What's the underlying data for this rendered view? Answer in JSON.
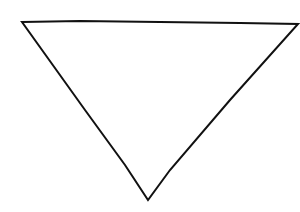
{
  "diagram": {
    "shape": "inverted-triangle",
    "style": "hand-drawn line art",
    "stroke_color": "#111111",
    "fill_color": "#ffffff",
    "background_color": "#ffffff",
    "vertices": {
      "top_left": [
        22,
        22
      ],
      "top_right": [
        298,
        24
      ],
      "bottom": [
        148,
        200
      ]
    },
    "points": "22,22 80,21 160,22 240,23 298,24 230,100 170,170 148,200 125,165 85,110 22,22"
  }
}
